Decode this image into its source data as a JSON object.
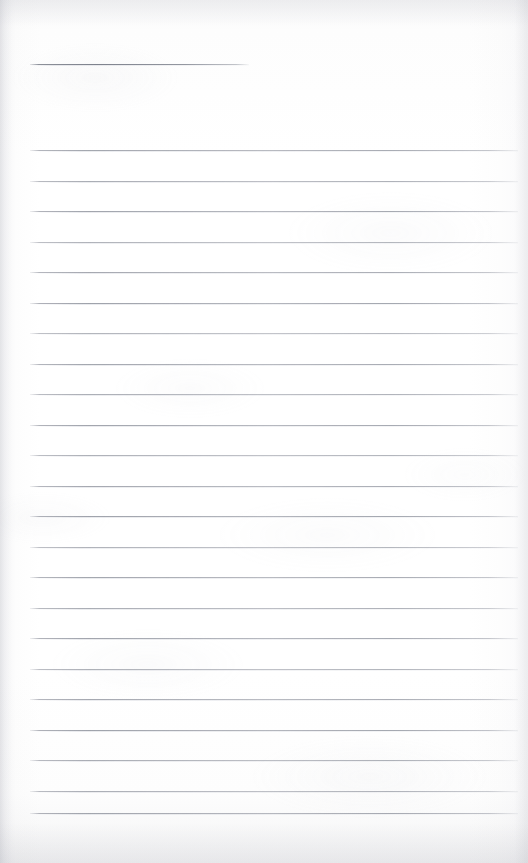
{
  "document": {
    "kind": "scanned-lined-paper",
    "title": "Blank lined notebook page",
    "page_width": 528,
    "page_height": 863,
    "text_content": "",
    "handwriting_present": "no",
    "printed_text_present": "no"
  },
  "appearance": {
    "paper_color": "#fefefe",
    "paper_color_shaded": "#f4f4f5",
    "rule_color": "#8f939d",
    "rule_color_light": "#b9bcc4",
    "edge_shadow_color": "#b0b2ba",
    "rule_thickness_px": 1
  },
  "layout": {
    "rule_left_x": 30,
    "rule_right_x": 518,
    "header_rule_right_x": 249,
    "body_first_rule_y": 150,
    "body_last_rule_y": 813,
    "rule_spacing_px": 30.5,
    "body_rule_count": 22,
    "header_rule_count": 1,
    "top_margin_px": 64,
    "bottom_blank_px": 50
  },
  "rules": [
    {
      "id": "header-rule-1",
      "y": 64,
      "x": 30,
      "width": 219,
      "tilt": 0.55,
      "opacity": 0.95,
      "role": "header"
    },
    {
      "id": "body-rule-1",
      "y": 150.0,
      "x": 30,
      "width": 488,
      "tilt": 0.3,
      "opacity": 0.86,
      "role": "body"
    },
    {
      "id": "body-rule-2",
      "y": 180.5,
      "x": 30,
      "width": 488,
      "tilt": 0.3,
      "opacity": 0.8,
      "role": "body"
    },
    {
      "id": "body-rule-3",
      "y": 211.0,
      "x": 30,
      "width": 488,
      "tilt": 0.3,
      "opacity": 0.88,
      "role": "body"
    },
    {
      "id": "body-rule-4",
      "y": 241.5,
      "x": 30,
      "width": 488,
      "tilt": 0.3,
      "opacity": 0.74,
      "role": "body"
    },
    {
      "id": "body-rule-5",
      "y": 272.0,
      "x": 30,
      "width": 488,
      "tilt": 0.3,
      "opacity": 0.84,
      "role": "body"
    },
    {
      "id": "body-rule-6",
      "y": 302.5,
      "x": 30,
      "width": 488,
      "tilt": 0.3,
      "opacity": 0.9,
      "role": "body"
    },
    {
      "id": "body-rule-7",
      "y": 333.0,
      "x": 30,
      "width": 488,
      "tilt": 0.3,
      "opacity": 0.72,
      "role": "body"
    },
    {
      "id": "body-rule-8",
      "y": 363.5,
      "x": 30,
      "width": 488,
      "tilt": 0.3,
      "opacity": 0.86,
      "role": "body"
    },
    {
      "id": "body-rule-9",
      "y": 394.0,
      "x": 30,
      "width": 488,
      "tilt": 0.3,
      "opacity": 0.78,
      "role": "body"
    },
    {
      "id": "body-rule-10",
      "y": 424.5,
      "x": 30,
      "width": 488,
      "tilt": 0.3,
      "opacity": 0.88,
      "role": "body"
    },
    {
      "id": "body-rule-11",
      "y": 455.0,
      "x": 30,
      "width": 488,
      "tilt": 0.3,
      "opacity": 0.76,
      "role": "body"
    },
    {
      "id": "body-rule-12",
      "y": 485.5,
      "x": 30,
      "width": 488,
      "tilt": 0.3,
      "opacity": 0.84,
      "role": "body"
    },
    {
      "id": "body-rule-13",
      "y": 516.0,
      "x": 30,
      "width": 488,
      "tilt": 0.3,
      "opacity": 0.9,
      "role": "body"
    },
    {
      "id": "body-rule-14",
      "y": 546.5,
      "x": 30,
      "width": 488,
      "tilt": 0.3,
      "opacity": 0.74,
      "role": "body"
    },
    {
      "id": "body-rule-15",
      "y": 577.0,
      "x": 30,
      "width": 488,
      "tilt": 0.3,
      "opacity": 0.86,
      "role": "body"
    },
    {
      "id": "body-rule-16",
      "y": 607.5,
      "x": 30,
      "width": 488,
      "tilt": 0.3,
      "opacity": 0.8,
      "role": "body"
    },
    {
      "id": "body-rule-17",
      "y": 638.0,
      "x": 30,
      "width": 488,
      "tilt": 0.3,
      "opacity": 0.88,
      "role": "body"
    },
    {
      "id": "body-rule-18",
      "y": 668.5,
      "x": 30,
      "width": 488,
      "tilt": 0.3,
      "opacity": 0.76,
      "role": "body"
    },
    {
      "id": "body-rule-19",
      "y": 699.0,
      "x": 30,
      "width": 488,
      "tilt": 0.3,
      "opacity": 0.84,
      "role": "body"
    },
    {
      "id": "body-rule-20",
      "y": 729.5,
      "x": 30,
      "width": 488,
      "tilt": 0.3,
      "opacity": 0.9,
      "role": "body"
    },
    {
      "id": "body-rule-21",
      "y": 760.0,
      "x": 30,
      "width": 488,
      "tilt": 0.3,
      "opacity": 0.8,
      "role": "body"
    },
    {
      "id": "body-rule-22",
      "y": 790.5,
      "x": 30,
      "width": 488,
      "tilt": 0.3,
      "opacity": 0.78,
      "role": "body"
    },
    {
      "id": "body-rule-23",
      "y": 813.0,
      "x": 30,
      "width": 488,
      "tilt": 0.3,
      "opacity": 0.88,
      "role": "body"
    }
  ]
}
